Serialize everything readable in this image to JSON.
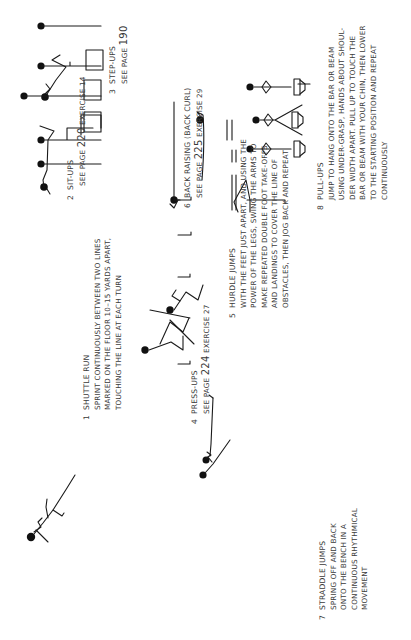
{
  "orientation": "rotated-90-ccw",
  "exercises": [
    {
      "number": "1",
      "title": "SHUTTLE RUN",
      "lines": [
        "SPRINT CONTINUOUSLY BETWEEN TWO LINES",
        "MARKED ON THE FLOOR 10–15 YARDS APART,",
        "TOUCHING THE LINE AT EACH TURN"
      ]
    },
    {
      "number": "2",
      "title": "SIT-UPS",
      "ref_prefix": "SEE PAGE",
      "ref_page": "220",
      "ref_suffix": "EXERCISE 14"
    },
    {
      "number": "3",
      "title": "STEP-UPS",
      "ref_prefix": "SEE PAGE",
      "ref_page": "190",
      "ref_suffix": ""
    },
    {
      "number": "4",
      "title": "PRESS-UPS",
      "ref_prefix": "SEE PAGE",
      "ref_page": "224",
      "ref_suffix": "EXERCISE 27"
    },
    {
      "number": "5",
      "title": "HURDLE JUMPS",
      "lines": [
        "WITH THE FEET JUST APART, AND USING THE",
        "POWER OF THE LEGS, SWING THE ARMS TO",
        "MAKE REPEATED DOUBLE FOOT TAKE-OFFS",
        "AND LANDINGS TO COVER THE LINE OF",
        "OBSTACLES, THEN JOG BACK AND REPEAT"
      ]
    },
    {
      "number": "6",
      "title": "BACK RAISING (BACK CURL)",
      "ref_prefix": "SEE PAGE",
      "ref_page": "225",
      "ref_suffix": "EXERCISE 29"
    },
    {
      "number": "7",
      "title": "STRADDLE JUMPS",
      "lines": [
        "SPRING OFF AND BACK",
        "ONTO THE BENCH IN A",
        "CONTINUOUS RHYTHMICAL",
        "MOVEMENT"
      ]
    },
    {
      "number": "8",
      "title": "PULL-UPS",
      "lines": [
        "JUMP TO HANG ONTO THE BAR OR BEAM",
        "USING UNDER-GRASP, HANDS ABOUT SHOUL-",
        "DER WIDTH APART. PULL UP TO TOUCH THE",
        "BAR OR BEAM WITH YOUR CHIN, THEN LOWER",
        "TO THE STARTING POSITION AND REPEAT",
        "CONTINUOUSLY"
      ]
    }
  ]
}
